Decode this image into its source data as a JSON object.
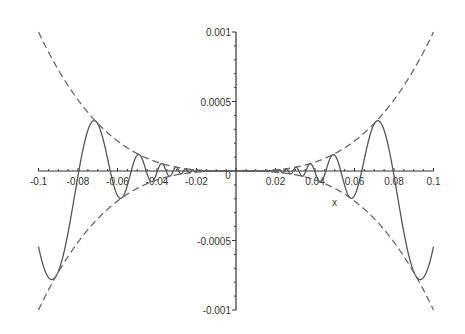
{
  "chart_data": {
    "type": "line",
    "title": "",
    "xlabel": "x",
    "ylabel": "",
    "xlim": [
      -0.1,
      0.1
    ],
    "ylim": [
      -0.001,
      0.001
    ],
    "grid": false,
    "legend": null,
    "x_ticks": [
      "-0.1",
      "-0.08",
      "-0.06",
      "-0.04",
      "-0.02",
      "0",
      "0.02",
      "0.04",
      "0.06",
      "0.08",
      "0.1"
    ],
    "y_ticks": [
      "0.001",
      "0.0005",
      "-0.0005",
      "-0.001"
    ],
    "series": [
      {
        "name": "x^3*sin(1/x)",
        "style": "solid",
        "color": "#555555",
        "expression": "x^3*sin(1/x)"
      },
      {
        "name": "x^3",
        "style": "dashed",
        "color": "#666666",
        "expression": "x^3"
      },
      {
        "name": "-x^3",
        "style": "dashed",
        "color": "#666666",
        "expression": "-x^3"
      }
    ]
  }
}
